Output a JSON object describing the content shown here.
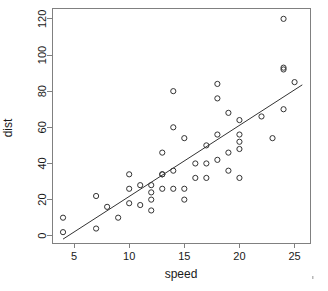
{
  "chart_data": {
    "type": "scatter",
    "title": "",
    "xlabel": "speed",
    "ylabel": "dist",
    "xlim": [
      3.0,
      26.4
    ],
    "ylim": [
      -4.0,
      126.0
    ],
    "xticks": [
      5,
      10,
      15,
      20,
      25
    ],
    "yticks": [
      0,
      20,
      40,
      60,
      80,
      100,
      120
    ],
    "xtick_labels": [
      "5",
      "10",
      "15",
      "20",
      "25"
    ],
    "ytick_labels": [
      "0",
      "20",
      "40",
      "60",
      "80",
      "100",
      "120"
    ],
    "grid": false,
    "legend": "none",
    "point_marker": "open-circle",
    "point_color": "#333333",
    "line_color": "#333333",
    "axis_color": "#808080",
    "background": "#ffffff",
    "x": [
      4,
      4,
      7,
      7,
      8,
      9,
      10,
      10,
      10,
      11,
      11,
      12,
      12,
      12,
      12,
      13,
      13,
      13,
      13,
      14,
      14,
      14,
      14,
      15,
      15,
      15,
      16,
      16,
      17,
      17,
      17,
      18,
      18,
      18,
      18,
      19,
      19,
      19,
      20,
      20,
      20,
      20,
      20,
      22,
      23,
      24,
      24,
      24,
      24,
      25
    ],
    "y": [
      2,
      10,
      4,
      22,
      16,
      10,
      18,
      26,
      34,
      17,
      28,
      14,
      20,
      24,
      28,
      26,
      34,
      34,
      46,
      26,
      36,
      60,
      80,
      20,
      26,
      54,
      32,
      40,
      32,
      40,
      50,
      42,
      56,
      76,
      84,
      36,
      46,
      68,
      32,
      48,
      52,
      56,
      64,
      66,
      54,
      70,
      92,
      93,
      120,
      85
    ],
    "series_name": "cars",
    "fit": {
      "type": "linear-regression",
      "slope": 3.9324,
      "intercept": -17.5791,
      "x_start": 4.0,
      "x_end": 25.7
    }
  },
  "axes": {
    "x_title": "speed",
    "y_title": "dist"
  }
}
